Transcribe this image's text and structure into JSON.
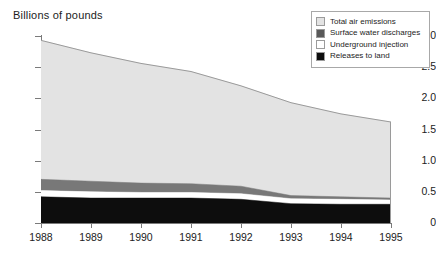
{
  "chart_data": {
    "type": "area",
    "title": "Billions of pounds",
    "subtitle": "",
    "xlabel": "",
    "ylabel": "Billions of pounds",
    "stacked": true,
    "grid": false,
    "legend_position": "top-right",
    "categories": [
      "1988",
      "1989",
      "1990",
      "1991",
      "1992",
      "1993",
      "1994",
      "1995"
    ],
    "x": [
      1988,
      1989,
      1990,
      1991,
      1992,
      1993,
      1994,
      1995
    ],
    "xlim": [
      1988,
      1995
    ],
    "ylim": [
      0,
      3.0
    ],
    "y_ticks": [
      "0",
      "0.5",
      "1.0",
      "1.5",
      "2.0",
      "2.5",
      "3.0"
    ],
    "y_tick_values": [
      0,
      0.5,
      1.0,
      1.5,
      2.0,
      2.5,
      3.0
    ],
    "series": [
      {
        "name": "Releases to land",
        "color": "#0d0d0d",
        "values": [
          0.42,
          0.4,
          0.4,
          0.4,
          0.38,
          0.31,
          0.3,
          0.3
        ]
      },
      {
        "name": "Underground injection",
        "color": "#ffffff",
        "values": [
          0.1,
          0.1,
          0.09,
          0.09,
          0.09,
          0.08,
          0.08,
          0.07
        ]
      },
      {
        "name": "Surface water discharges",
        "color": "#787878",
        "values": [
          0.18,
          0.17,
          0.15,
          0.14,
          0.12,
          0.05,
          0.04,
          0.03
        ]
      },
      {
        "name": "Total air emissions",
        "color": "#e3e3e3",
        "values": [
          2.23,
          2.06,
          1.92,
          1.8,
          1.61,
          1.49,
          1.33,
          1.22
        ]
      }
    ],
    "cumulative_tops": {
      "releases_to_land": [
        0.42,
        0.4,
        0.4,
        0.4,
        0.38,
        0.31,
        0.3,
        0.3
      ],
      "underground_injection": [
        0.52,
        0.5,
        0.49,
        0.49,
        0.47,
        0.39,
        0.38,
        0.37
      ],
      "surface_water_discharges": [
        0.7,
        0.67,
        0.64,
        0.63,
        0.59,
        0.44,
        0.42,
        0.4
      ],
      "total": [
        2.93,
        2.73,
        2.56,
        2.43,
        2.2,
        1.93,
        1.75,
        1.62
      ]
    },
    "annotations": []
  },
  "legend": {
    "items": [
      {
        "label": "Total air emissions",
        "color": "#e3e3e3"
      },
      {
        "label": "Surface water discharges",
        "color": "#595959"
      },
      {
        "label": "Underground injection",
        "color": "#ffffff"
      },
      {
        "label": "Releases to land",
        "color": "#0d0d0d"
      }
    ]
  },
  "colors": {
    "axis": "#7a7a7a",
    "text": "#1c1c1c",
    "background": "#ffffff",
    "legend_border": "#a8a8a8"
  }
}
